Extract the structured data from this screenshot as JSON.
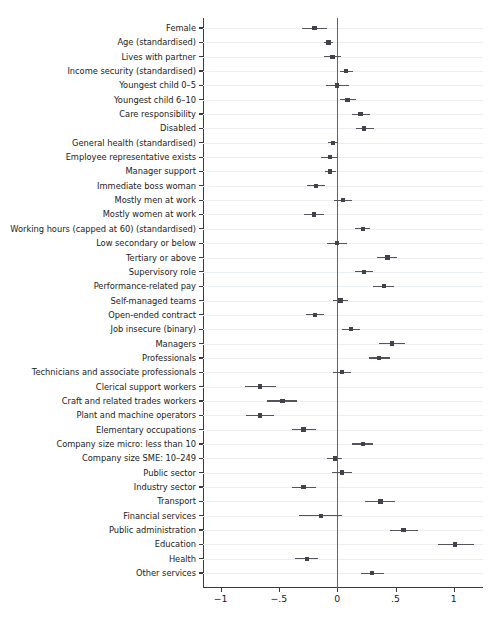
{
  "chart_data": {
    "type": "scatter",
    "title": "",
    "subtitle": "",
    "xlabel": "",
    "ylabel": "",
    "xlim": [
      -1.15,
      1.25
    ],
    "xticks": [
      -1,
      -0.5,
      0,
      0.5,
      1
    ],
    "xtick_labels": [
      "-1",
      "-.5",
      "0",
      ".5",
      "1"
    ],
    "grid": true,
    "legend": "none",
    "reference_line": 0,
    "orientation": "horizontal",
    "categories": [
      "Female",
      "Age (standardised)",
      "Lives with partner",
      "Income security (standardised)",
      "Youngest child 0–5",
      "Youngest child 6–10",
      "Care responsibility",
      "Disabled",
      "General health (standardised)",
      "Employee representative exists",
      "Manager support",
      "Immediate boss woman",
      "Mostly men at work",
      "Mostly women at work",
      "Working hours (capped at 60) (standardised)",
      "Low secondary or below",
      "Tertiary or above",
      "Supervisory role",
      "Performance-related pay",
      "Self-managed teams",
      "Open-ended contract",
      "Job insecure (binary)",
      "Managers",
      "Professionals",
      "Technicians and associate professionals",
      "Clerical support workers",
      "Craft and related trades workers",
      "Plant and machine operators",
      "Elementary occupations",
      "Company size micro: less than 10",
      "Company size SME: 10–249",
      "Public sector",
      "Industry sector",
      "Transport",
      "Financial services",
      "Public administration",
      "Education",
      "Health",
      "Other services"
    ],
    "values": [
      -0.195,
      -0.075,
      -0.04,
      0.075,
      0.0,
      0.09,
      0.2,
      0.23,
      -0.035,
      -0.06,
      -0.06,
      -0.18,
      0.05,
      -0.2,
      0.22,
      0.0,
      0.43,
      0.23,
      0.4,
      0.03,
      -0.19,
      0.12,
      0.47,
      0.36,
      0.04,
      -0.66,
      -0.47,
      -0.66,
      -0.29,
      0.22,
      -0.02,
      0.04,
      -0.29,
      0.37,
      -0.14,
      0.57,
      1.01,
      -0.26,
      0.3
    ],
    "ci_low": [
      -0.305,
      -0.115,
      -0.11,
      0.02,
      -0.1,
      0.025,
      0.125,
      0.16,
      -0.08,
      -0.135,
      -0.105,
      -0.255,
      -0.025,
      -0.285,
      0.155,
      -0.09,
      0.345,
      0.155,
      0.31,
      -0.04,
      -0.265,
      0.045,
      0.36,
      0.275,
      -0.035,
      -0.79,
      -0.6,
      -0.78,
      -0.39,
      0.13,
      -0.085,
      -0.045,
      -0.39,
      0.235,
      -0.33,
      0.45,
      0.86,
      -0.36,
      0.2
    ],
    "ci_high": [
      -0.09,
      -0.035,
      0.03,
      0.135,
      0.105,
      0.165,
      0.285,
      0.315,
      0.01,
      0.005,
      -0.01,
      -0.105,
      0.13,
      -0.115,
      0.28,
      0.085,
      0.515,
      0.305,
      0.49,
      0.095,
      -0.115,
      0.195,
      0.58,
      0.45,
      0.115,
      -0.525,
      -0.345,
      -0.545,
      -0.185,
      0.31,
      0.045,
      0.125,
      -0.185,
      0.5,
      0.045,
      0.69,
      1.175,
      -0.165,
      0.4
    ],
    "colors": {
      "marker": "#43424a",
      "whisker": "#55545a",
      "zero_line": "#5b6470",
      "grid": "#eceff2",
      "axis": "#3a3a3a",
      "background": "#ffffff",
      "text": "#1b1b1b"
    }
  }
}
